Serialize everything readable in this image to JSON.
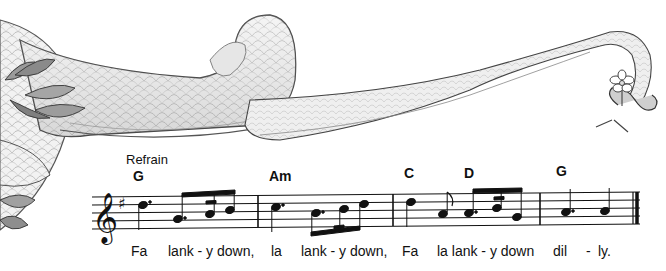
{
  "illustration": {
    "subject": "scaly dragon tail curling across top of page with leafy foliage at left and small flower at tail tip",
    "style": "grayscale pencil drawing"
  },
  "song": {
    "section_label": "Refrain",
    "clef": "treble",
    "key_signature": "G major (one sharp, F#)",
    "chords": [
      {
        "label": "G",
        "x": 133,
        "y": 168
      },
      {
        "label": "Am",
        "x": 269,
        "y": 168
      },
      {
        "label": "C",
        "x": 404,
        "y": 165
      },
      {
        "label": "D",
        "x": 464,
        "y": 165
      },
      {
        "label": "G",
        "x": 556,
        "y": 163
      }
    ],
    "lyrics": [
      {
        "text": "Fa",
        "x": 131
      },
      {
        "text": "lank - y down,",
        "x": 168
      },
      {
        "text": "la",
        "x": 271
      },
      {
        "text": "lank - y down,",
        "x": 301
      },
      {
        "text": "Fa",
        "x": 402
      },
      {
        "text": "la lank - y down",
        "x": 437
      },
      {
        "text": "dil",
        "x": 553
      },
      {
        "text": "-",
        "x": 586
      },
      {
        "text": "ly.",
        "x": 598
      }
    ],
    "measures": 4
  }
}
